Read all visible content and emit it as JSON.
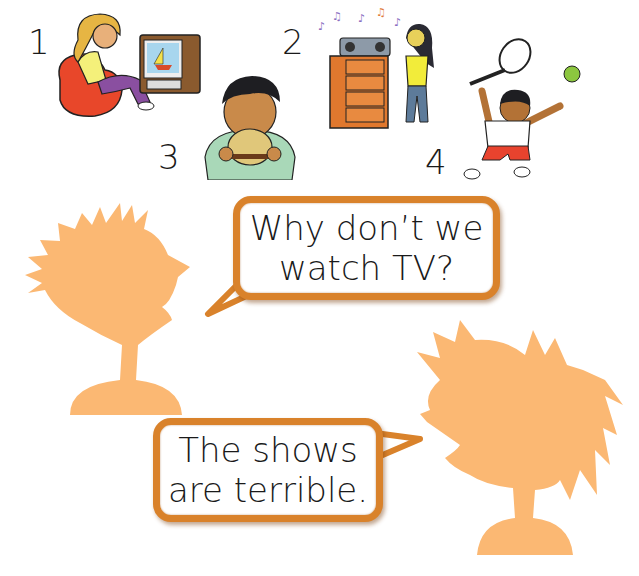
{
  "scene": {
    "title": "",
    "background": "#ffffff",
    "silhouette_color": "#fbb873",
    "bubble_border_color": "#d9822b"
  },
  "pictures": [
    {
      "number": "1",
      "label": "watch-tv",
      "description": "Girl sitting on a red beanbag watching TV showing a sailboat"
    },
    {
      "number": "2",
      "label": "listen-to-music",
      "description": "Girl standing next to a stereo on a dresser playing music"
    },
    {
      "number": "3",
      "label": "eat-hamburger",
      "description": "Boy eating a hamburger"
    },
    {
      "number": "4",
      "label": "play-tennis",
      "description": "Boy playing tennis with racket and ball"
    }
  ],
  "dialogue": {
    "speaker_a": {
      "silhouette": "spiky-haired-boy",
      "bubble": {
        "line1": "Why don’t we",
        "line2": "watch TV?"
      }
    },
    "speaker_b": {
      "silhouette": "ponytail-girl",
      "bubble": {
        "line1": "The shows",
        "line2": "are terrible."
      }
    }
  }
}
